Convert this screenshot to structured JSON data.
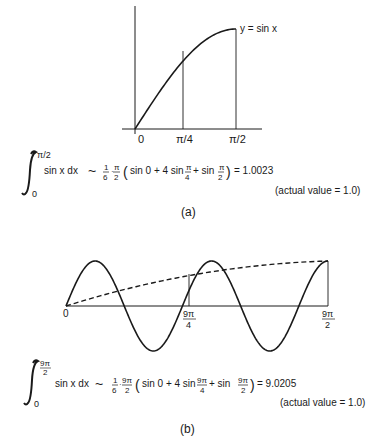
{
  "figure_a": {
    "curve_label": "y = sin x",
    "ticks": [
      "0",
      "π/4",
      "π/2"
    ],
    "integral": {
      "upper_limit": "π/2",
      "lower_limit": "0",
      "integrand": "sin x dx",
      "approx": "~",
      "coef_num": "1",
      "coef_den": "6",
      "h_num": "π",
      "h_den": "2",
      "open_paren": "(",
      "term1": "sin 0 + 4 sin",
      "frac1_num": "π",
      "frac1_den": "4",
      "term2": "+ sin",
      "frac2_num": "π",
      "frac2_den": "2",
      "close_paren": ")",
      "result": "= 1.0023"
    },
    "actual": "(actual value = 1.0)",
    "caption": "(a)"
  },
  "figure_b": {
    "ticks": [
      "0",
      "9π",
      "4",
      "9π",
      "2"
    ],
    "integral": {
      "upper_num": "9π",
      "upper_den": "2",
      "lower_limit": "0",
      "integrand": "sin x dx",
      "approx": "~",
      "coef_num": "1",
      "coef_den": "6",
      "h_num": "9π",
      "h_den": "2",
      "open_paren": "(",
      "term1": "sin 0 + 4 sin",
      "frac1_num": "9π",
      "frac1_den": "4",
      "term2": "+ sin",
      "frac2_num": "9π",
      "frac2_den": "2",
      "close_paren": ")",
      "result": "= 9.0205"
    },
    "actual": "(actual value = 1.0)",
    "caption": "(b)"
  },
  "chart_data": [
    {
      "type": "line",
      "title": "(a)",
      "series": [
        {
          "name": "y = sin x",
          "x_range": [
            0,
            1.5708
          ]
        }
      ],
      "x_ticks": [
        "0",
        "π/4",
        "π/2"
      ],
      "vertical_markers": [
        "π/4",
        "π/2"
      ],
      "xlabel": "",
      "ylabel": ""
    },
    {
      "type": "line",
      "title": "(b)",
      "series": [
        {
          "name": "sin x",
          "x_range": [
            0,
            14.137
          ]
        },
        {
          "name": "parabolic approximation (dashed)",
          "points": [
            [
              0,
              0
            ],
            [
              7.069,
              0.707
            ],
            [
              14.137,
              1
            ]
          ]
        }
      ],
      "x_ticks": [
        "0",
        "9π/4",
        "9π/2"
      ],
      "vertical_markers": [
        "9π/4",
        "9π/2"
      ],
      "xlabel": "",
      "ylabel": ""
    }
  ]
}
